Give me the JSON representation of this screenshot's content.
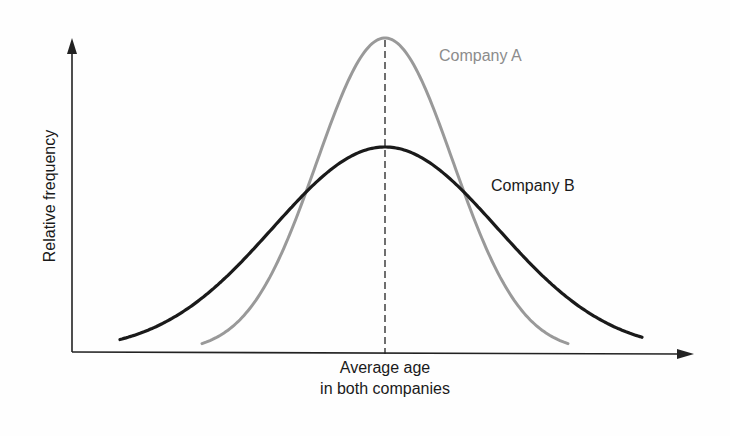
{
  "chart_data": {
    "type": "line",
    "title": "",
    "xlabel": "Average age in both companies",
    "xlabel_lines": [
      "Average age",
      "in both companies"
    ],
    "ylabel": "Relative frequency",
    "grid": false,
    "legend_position": "inline labels next to curves",
    "annotations": [
      "Dashed vertical line at the common mean (average age)"
    ],
    "x": [
      -3,
      -2.5,
      -2,
      -1.5,
      -1,
      -0.5,
      0,
      0.5,
      1,
      1.5,
      2,
      2.5,
      3
    ],
    "series": [
      {
        "name": "Company A",
        "color": "#999999",
        "shape": "narrow normal curve, higher peak",
        "peak": 1.0,
        "relative_std": 0.55
      },
      {
        "name": "Company B",
        "color": "#1a1a1a",
        "shape": "wide normal curve, lower peak",
        "peak": 0.65,
        "relative_std": 1.0
      }
    ],
    "mean_marker": {
      "label": "Average age in both companies",
      "style": "dashed"
    }
  },
  "labels": {
    "y_axis": "Relative frequency",
    "company_a": "Company A",
    "company_b": "Company B",
    "x_axis_line1": "Average age",
    "x_axis_line2": "in both companies"
  },
  "colors": {
    "company_a": "#999999",
    "company_b": "#1a1a1a",
    "axes": "#222222"
  }
}
